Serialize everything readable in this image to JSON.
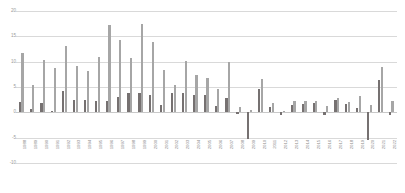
{
  "chart_data": {
    "type": "bar",
    "title": "",
    "subtitle": "",
    "xlabel": "",
    "ylabel": "",
    "ylim": [
      -10,
      20
    ],
    "yticks": [
      20,
      15,
      10,
      5,
      0,
      -5,
      -10
    ],
    "ytick_labels": [
      "20",
      "15",
      "10",
      "5",
      "0",
      "-5",
      "-10"
    ],
    "grid": true,
    "legend_position": "none",
    "categories": [
      "1988",
      "1989",
      "1990",
      "1991",
      "1992",
      "1993",
      "1994",
      "1995",
      "1996",
      "1997",
      "1998",
      "1999",
      "2000",
      "2001",
      "2002",
      "2003",
      "2004",
      "2005",
      "2006",
      "2007",
      "2008",
      "2009",
      "2010",
      "2011",
      "2012",
      "2013",
      "2014",
      "2015",
      "2016",
      "2017",
      "2018",
      "2019",
      "2020",
      "2021",
      "2022"
    ],
    "series": [
      {
        "name": "Series 1",
        "color": "#767171",
        "values": [
          2.0,
          0.6,
          1.8,
          0.3,
          4.3,
          2.5,
          2.4,
          2.3,
          2.3,
          3.0,
          3.8,
          3.8,
          3.5,
          1.5,
          3.8,
          3.8,
          3.4,
          3.4,
          1.2,
          2.9,
          -0.4,
          -5.2,
          4.7,
          1.1,
          -0.6,
          1.5,
          1.7,
          1.8,
          -0.5,
          2.4,
          1.7,
          0.8,
          -5.5,
          6.3,
          -0.5
        ]
      },
      {
        "name": "Series 2",
        "color": "#a6a6a6",
        "values": [
          11.8,
          5.4,
          10.3,
          8.7,
          13.1,
          9.2,
          8.2,
          10.9,
          17.2,
          14.3,
          10.7,
          17.5,
          13.9,
          8.4,
          5.4,
          10.2,
          7.4,
          6.7,
          4.7,
          9.9,
          1.0,
          0.4,
          6.6,
          1.8,
          0.2,
          2.3,
          2.2,
          2.3,
          1.2,
          2.8,
          2.1,
          3.3,
          1.4,
          9.0,
          2.2
        ]
      }
    ]
  }
}
